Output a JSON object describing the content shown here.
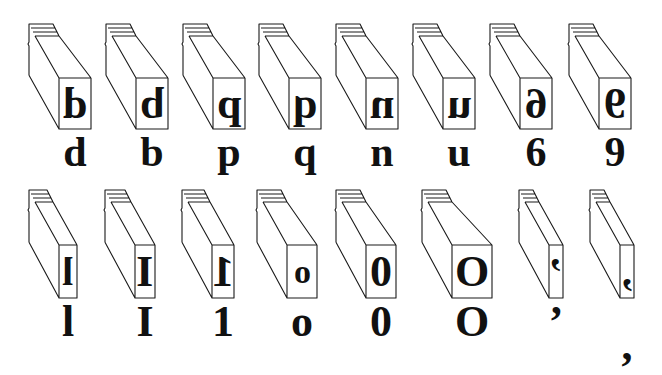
{
  "figure": {
    "rows": [
      {
        "row": 1,
        "blocks": [
          {
            "face": "d",
            "printed": "d",
            "x": 29,
            "w": 32
          },
          {
            "face": "b",
            "printed": "b",
            "x": 106,
            "w": 32
          },
          {
            "face": "p",
            "printed": "p",
            "x": 183,
            "w": 32
          },
          {
            "face": "q",
            "printed": "q",
            "x": 259,
            "w": 32
          },
          {
            "face": "n",
            "printed": "n",
            "x": 336,
            "w": 32
          },
          {
            "face": "u",
            "printed": "u",
            "x": 413,
            "w": 32
          },
          {
            "face": "6",
            "printed": "6",
            "x": 490,
            "w": 32
          },
          {
            "face": "9",
            "printed": "9",
            "x": 569,
            "w": 32
          }
        ]
      },
      {
        "row": 2,
        "blocks": [
          {
            "face": "l",
            "printed": "l",
            "x": 29,
            "w": 18
          },
          {
            "face": "I",
            "printed": "I",
            "x": 105,
            "w": 20
          },
          {
            "face": "1",
            "printed": "1",
            "x": 182,
            "w": 22
          },
          {
            "face": "o",
            "printed": "o",
            "x": 257,
            "w": 30
          },
          {
            "face": "0",
            "printed": "0",
            "x": 336,
            "w": 30
          },
          {
            "face": "O",
            "printed": "O",
            "x": 422,
            "w": 40
          },
          {
            "face": "’",
            "printed": "’",
            "x": 519,
            "w": 14
          },
          {
            "face": ",",
            "printed": ",",
            "x": 590,
            "w": 14
          }
        ]
      }
    ]
  }
}
